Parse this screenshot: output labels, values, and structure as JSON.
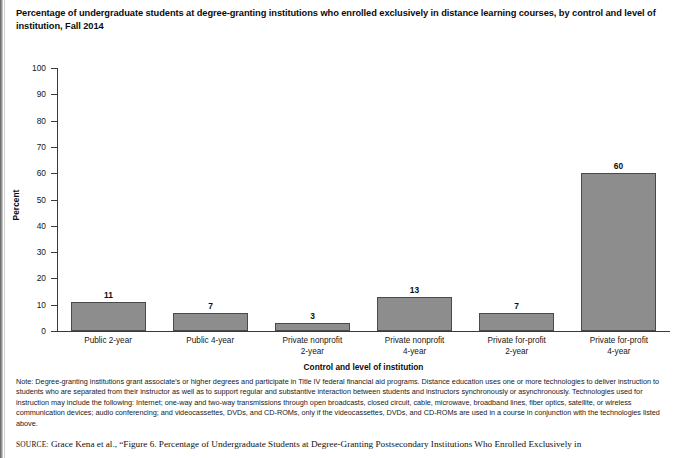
{
  "figure": {
    "title": "Percentage of undergraduate students at degree-granting institutions who enrolled exclusively in distance learning courses, by control and level of institution, Fall 2014",
    "note_label": "Note:",
    "note": "Degree-granting institutions grant associate's or higher degrees and participate in Title IV federal financial aid programs. Distance education uses one or more technologies to deliver instruction to students who are separated from their instructor as well as to support regular and substantive interaction between students and instructors synchronously or asynchronously. Technologies used for instruction may include the following: Internet; one-way and two-way transmissions through open broadcasts, closed circuit, cable, microwave, broadband lines, fiber optics, satellite, or wireless communication devices; audio conferencing; and videocassettes, DVDs, and CD-ROMs, only if the videocassettes, DVDs, and CD-ROMs are used in a course in conjunction with the technologies listed above.",
    "source_label": "SOURCE:",
    "source": "Grace Kena et al., “Figure 6. Percentage of Undergraduate Students at Degree-Granting Postsecondary Institutions Who Enrolled Exclusively in"
  },
  "chart_data": {
    "type": "bar",
    "title": "Percentage of undergraduate students at degree-granting institutions who enrolled exclusively in distance learning courses, by control and level of institution, Fall 2014",
    "xlabel": "Control and level of institution",
    "ylabel": "Percent",
    "ylim": [
      0,
      100
    ],
    "yticks": [
      0,
      10,
      20,
      30,
      40,
      50,
      60,
      70,
      80,
      90,
      100
    ],
    "ytick_labels": [
      "0",
      "10",
      "20",
      "30",
      "40",
      "50",
      "60",
      "70",
      "80",
      "90",
      "100"
    ],
    "grid": false,
    "legend": null,
    "bar_color": "#8d8d8d",
    "bar_edge_color": "#4a4a4a",
    "categories": [
      "Public 2-year",
      "Public 4-year",
      "Private nonprofit\n2-year",
      "Private nonprofit\n4-year",
      "Private for-profit\n2-year",
      "Private for-profit\n4-year"
    ],
    "category_lines": [
      [
        "Public 2-year",
        ""
      ],
      [
        "Public 4-year",
        ""
      ],
      [
        "Private nonprofit",
        "2-year"
      ],
      [
        "Private nonprofit",
        "4-year"
      ],
      [
        "Private for-profit",
        "2-year"
      ],
      [
        "Private for-profit",
        "4-year"
      ]
    ],
    "values": [
      11,
      7,
      3,
      13,
      7,
      60
    ],
    "value_labels": [
      "11",
      "7",
      "3",
      "13",
      "7",
      "60"
    ]
  }
}
